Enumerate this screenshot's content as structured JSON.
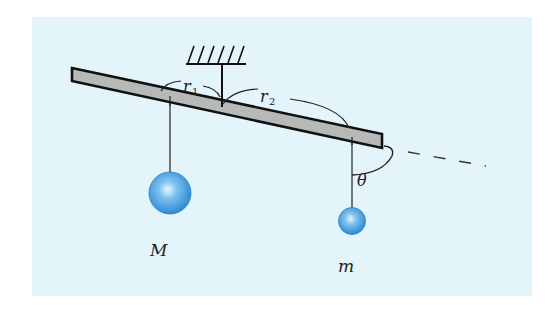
{
  "diagram": {
    "background_color": "#e3f4fa",
    "bar_fill": "#b7b9b9",
    "bar_stroke": "#111111",
    "ball_color": "#3a9be0",
    "labels": {
      "r1": "r",
      "r1_sub": "1",
      "r2": "r",
      "r2_sub": "2",
      "theta": "θ",
      "big_mass": "M",
      "small_mass": "m"
    },
    "elements": {
      "ceiling": "hatched-ceiling-support",
      "pivot": "vertical-pivot-rod",
      "lever": "tilted-rigid-bar",
      "dashed_line": "bar-extension-line",
      "angle": "theta-angle-arc",
      "mass_left": "large-sphere-M",
      "mass_right": "small-sphere-m"
    }
  }
}
